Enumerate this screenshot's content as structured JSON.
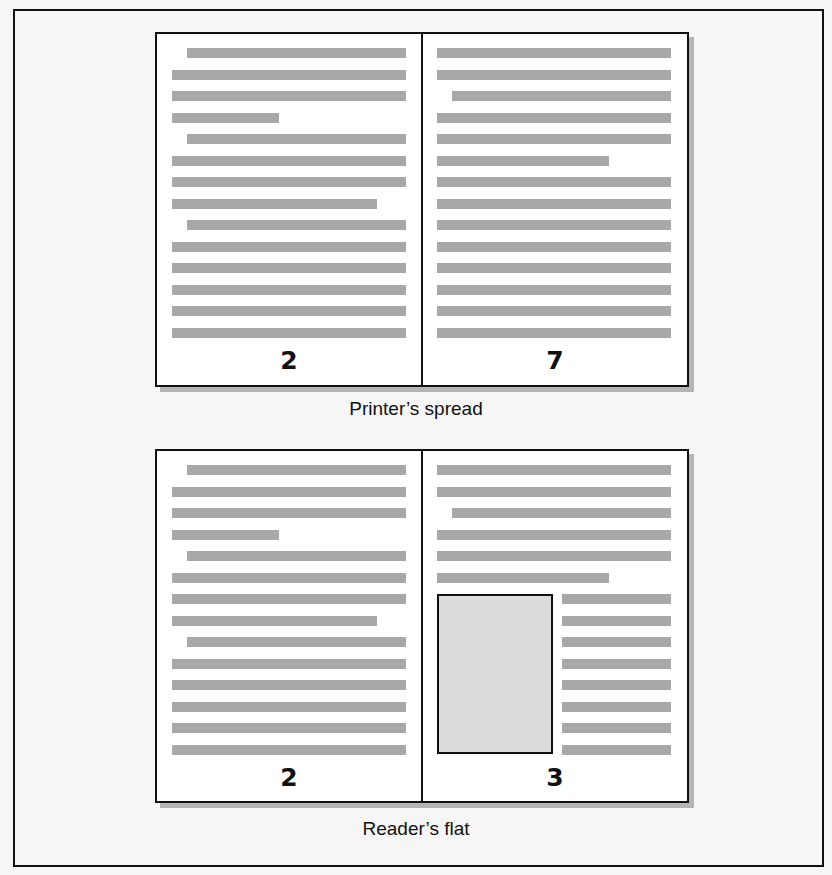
{
  "colors": {
    "background": "#f6f6f6",
    "page": "#ffffff",
    "border": "#111111",
    "text_line": "#a8a8a8",
    "shadow": "#b5b5b5",
    "figure_fill": "#dcdcdc"
  },
  "spreads": [
    {
      "caption": "Printer’s spread",
      "left_page": {
        "number": "2",
        "lines": [
          {
            "indent": true,
            "short": null
          },
          {
            "indent": false,
            "short": null
          },
          {
            "indent": false,
            "short": null
          },
          {
            "indent": false,
            "short": 107
          },
          {
            "indent": true,
            "short": null
          },
          {
            "indent": false,
            "short": null
          },
          {
            "indent": false,
            "short": null
          },
          {
            "indent": false,
            "short": 205
          },
          {
            "indent": true,
            "short": null
          },
          {
            "indent": false,
            "short": null
          },
          {
            "indent": false,
            "short": null
          },
          {
            "indent": false,
            "short": null
          },
          {
            "indent": false,
            "short": null
          },
          {
            "indent": false,
            "short": null
          }
        ]
      },
      "right_page": {
        "number": "7",
        "lines": [
          {
            "indent": false,
            "short": null
          },
          {
            "indent": false,
            "short": null
          },
          {
            "indent": true,
            "short": null
          },
          {
            "indent": false,
            "short": null
          },
          {
            "indent": false,
            "short": null
          },
          {
            "indent": false,
            "short": 172
          },
          {
            "indent": false,
            "short": null
          },
          {
            "indent": false,
            "short": null
          },
          {
            "indent": false,
            "short": null
          },
          {
            "indent": false,
            "short": null
          },
          {
            "indent": false,
            "short": null
          },
          {
            "indent": false,
            "short": null
          },
          {
            "indent": false,
            "short": null
          },
          {
            "indent": false,
            "short": null
          }
        ],
        "figure": null
      }
    },
    {
      "caption": "Reader’s flat",
      "left_page": {
        "number": "2",
        "lines": [
          {
            "indent": true,
            "short": null
          },
          {
            "indent": false,
            "short": null
          },
          {
            "indent": false,
            "short": null
          },
          {
            "indent": false,
            "short": 107
          },
          {
            "indent": true,
            "short": null
          },
          {
            "indent": false,
            "short": null
          },
          {
            "indent": false,
            "short": null
          },
          {
            "indent": false,
            "short": 205
          },
          {
            "indent": true,
            "short": null
          },
          {
            "indent": false,
            "short": null
          },
          {
            "indent": false,
            "short": null
          },
          {
            "indent": false,
            "short": null
          },
          {
            "indent": false,
            "short": null
          },
          {
            "indent": false,
            "short": null
          }
        ]
      },
      "right_page": {
        "number": "3",
        "lines": [
          {
            "indent": false,
            "short": null
          },
          {
            "indent": false,
            "short": null
          },
          {
            "indent": true,
            "short": null
          },
          {
            "indent": false,
            "short": null
          },
          {
            "indent": false,
            "short": null
          },
          {
            "indent": false,
            "short": 172
          }
        ],
        "figure": {
          "label": "image-placeholder",
          "side_lines": 8
        }
      }
    }
  ]
}
